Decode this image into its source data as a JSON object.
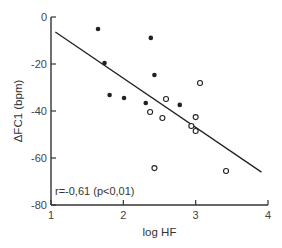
{
  "chart_data": {
    "type": "scatter",
    "title": "",
    "xlabel": "log HF",
    "ylabel": "ΔFC1 (bpm)",
    "xlim": [
      1,
      4
    ],
    "ylim": [
      -80,
      0
    ],
    "xticks": [
      "1",
      "2",
      "3",
      "4"
    ],
    "yticks": [
      "0",
      "-20",
      "-40",
      "-60",
      "-80"
    ],
    "grid": false,
    "legend": null,
    "annotation": "r=-0,61 (p<0,01)",
    "regression_line": {
      "x": [
        1.06,
        3.91
      ],
      "y": [
        -6.4,
        -66.0
      ]
    },
    "series": [
      {
        "name": "filled",
        "marker": "filled-circle",
        "color": "#222222",
        "points": [
          {
            "x": 1.65,
            "y": -5.1
          },
          {
            "x": 1.74,
            "y": -19.6
          },
          {
            "x": 1.81,
            "y": -33.2
          },
          {
            "x": 2.01,
            "y": -34.5
          },
          {
            "x": 2.38,
            "y": -8.9
          },
          {
            "x": 2.43,
            "y": -24.7
          },
          {
            "x": 2.31,
            "y": -36.6
          },
          {
            "x": 2.78,
            "y": -37.4
          }
        ]
      },
      {
        "name": "open",
        "marker": "open-circle",
        "color": "#222222",
        "points": [
          {
            "x": 3.06,
            "y": -28.1
          },
          {
            "x": 2.59,
            "y": -34.9
          },
          {
            "x": 2.37,
            "y": -40.4
          },
          {
            "x": 2.54,
            "y": -43.0
          },
          {
            "x": 3.0,
            "y": -42.6
          },
          {
            "x": 2.94,
            "y": -46.4
          },
          {
            "x": 3.0,
            "y": -48.5
          },
          {
            "x": 2.43,
            "y": -64.3
          },
          {
            "x": 3.42,
            "y": -65.5
          }
        ]
      }
    ]
  }
}
